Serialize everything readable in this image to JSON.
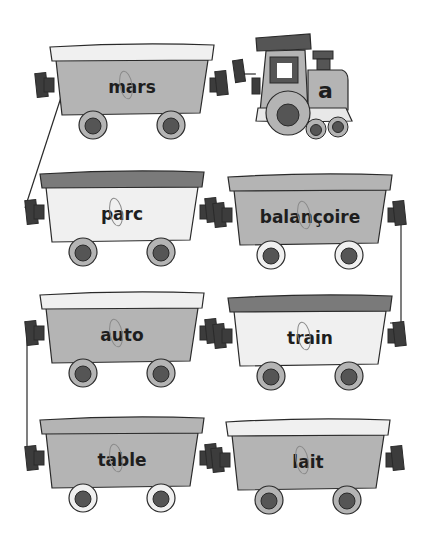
{
  "worksheet": {
    "target_letter": "a",
    "locomotive": {
      "label": "a"
    },
    "wagons": [
      {
        "word": "mars",
        "traced_letter": "a",
        "row": 0,
        "col": 0,
        "roof": "light",
        "body": "mid",
        "wheel_rim": "mid"
      },
      {
        "word": "parc",
        "traced_letter": "a",
        "row": 1,
        "col": 0,
        "roof": "dark",
        "body": "light",
        "wheel_rim": "mid"
      },
      {
        "word": "balançoire",
        "traced_letter": "a",
        "row": 1,
        "col": 1,
        "roof": "mid",
        "body": "mid",
        "wheel_rim": "light"
      },
      {
        "word": "auto",
        "traced_letter": "a",
        "row": 2,
        "col": 0,
        "roof": "light",
        "body": "mid",
        "wheel_rim": "mid"
      },
      {
        "word": "train",
        "traced_letter": "a",
        "row": 2,
        "col": 1,
        "roof": "dark",
        "body": "light",
        "wheel_rim": "mid"
      },
      {
        "word": "table",
        "traced_letter": "a",
        "row": 3,
        "col": 0,
        "roof": "mid",
        "body": "mid",
        "wheel_rim": "light"
      },
      {
        "word": "lait",
        "traced_letter": "a",
        "row": 3,
        "col": 1,
        "roof": "light",
        "body": "mid",
        "wheel_rim": "mid"
      }
    ]
  },
  "colors": {
    "light": "#f0f0f0",
    "mid": "#b4b4b4",
    "dark": "#7a7a7a",
    "coupler": "#3c3c3c",
    "outline": "#2a2a2a",
    "hub": "#555555",
    "trace": "#8a8a8a"
  }
}
